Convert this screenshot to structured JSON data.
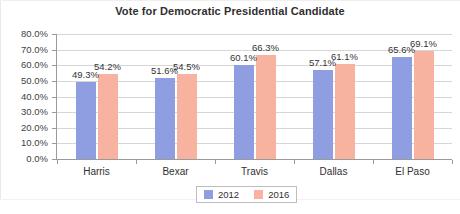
{
  "chart_data": {
    "type": "bar",
    "title": "Vote for Democratic Presidential Candidate",
    "xlabel": "",
    "ylabel": "",
    "ylim": [
      0,
      80
    ],
    "ytick_step": 10,
    "grid": true,
    "legend_position": "bottom",
    "categories": [
      "Harris",
      "Bexar",
      "Travis",
      "Dallas",
      "El Paso"
    ],
    "ytick_labels": [
      "0.0%",
      "10.0%",
      "20.0%",
      "30.0%",
      "40.0%",
      "50.0%",
      "60.0%",
      "70.0%",
      "80.0%"
    ],
    "ytick_values": [
      0,
      10,
      20,
      30,
      40,
      50,
      60,
      70,
      80
    ],
    "series": [
      {
        "name": "2012",
        "color": "#8e9ee0",
        "values": [
          49.3,
          51.6,
          60.1,
          57.1,
          65.6
        ],
        "labels": [
          "49.3%",
          "51.6%",
          "60.1%",
          "57.1%",
          "65.6%"
        ]
      },
      {
        "name": "2016",
        "color": "#f8b3a0",
        "values": [
          54.2,
          54.5,
          66.3,
          61.1,
          69.1
        ],
        "labels": [
          "54.2%",
          "54.5%",
          "66.3%",
          "61.1%",
          "69.1%"
        ]
      }
    ]
  }
}
